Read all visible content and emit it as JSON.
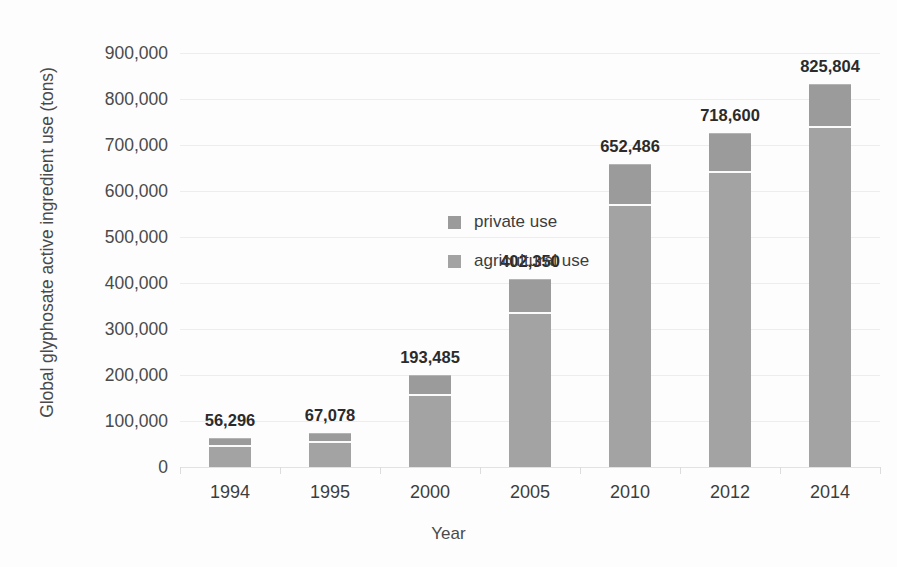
{
  "chart_data": {
    "type": "bar",
    "stacked": true,
    "title": "",
    "xlabel": "Year",
    "ylabel": "Global glyphosate active ingredient use (tons)",
    "categories": [
      "1994",
      "1995",
      "2000",
      "2005",
      "2010",
      "2012",
      "2014"
    ],
    "series": [
      {
        "name": "agricultural use",
        "color": "#a3a3a3",
        "values": [
          43000,
          53000,
          155000,
          333000,
          568000,
          639000,
          736000
        ]
      },
      {
        "name": "private use",
        "color": "#9b9b9b",
        "values": [
          13296,
          14078,
          38485,
          69350,
          84486,
          79600,
          89804
        ]
      }
    ],
    "totals": [
      56296,
      67078,
      193485,
      402350,
      652486,
      718600,
      825804
    ],
    "data_labels": [
      "56,296",
      "67,078",
      "193,485",
      "402,350",
      "652,486",
      "718,600",
      "825,804"
    ],
    "ylim": [
      0,
      900000
    ],
    "yticks": [
      0,
      100000,
      200000,
      300000,
      400000,
      500000,
      600000,
      700000,
      800000,
      900000
    ],
    "ytick_labels": [
      "0",
      "100,000",
      "200,000",
      "300,000",
      "400,000",
      "500,000",
      "600,000",
      "700,000",
      "800,000",
      "900,000"
    ],
    "grid": true,
    "legend_position": "inside-upper-left"
  },
  "axes": {
    "y_title": "Global glyphosate active ingredient use (tons)",
    "x_title": "Year"
  },
  "legend": {
    "entries": [
      {
        "label": "private use",
        "swatch_color": "#9b9b9b"
      },
      {
        "label": "agricultural use",
        "swatch_color": "#a3a3a3"
      }
    ]
  },
  "colors": {
    "bar_agricultural": "#a3a3a3",
    "bar_private": "#9b9b9b",
    "gridline": "#ededed",
    "text": "#3d3d3d",
    "background": "#fdfdfd"
  }
}
